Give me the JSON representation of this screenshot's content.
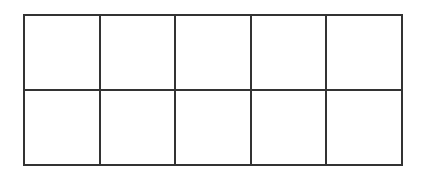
{
  "figure": {
    "type": "ten-frame",
    "columns": 5,
    "rows": 2,
    "total_cells": 10,
    "filled_count": 0,
    "empty_count": 10,
    "background_color": "#ffffff",
    "line_color": "#333333",
    "line_width_px": 2,
    "cell_fill_color": "#ffffff",
    "frame": {
      "left_px": 23,
      "top_px": 14,
      "width_px": 380,
      "height_px": 152,
      "cell_width_px": 76,
      "cell_height_px": 76
    }
  },
  "cells": [
    {
      "id": "cell-r1c1",
      "row": 1,
      "column": 1,
      "filled": false,
      "label": ""
    },
    {
      "id": "cell-r1c2",
      "row": 1,
      "column": 2,
      "filled": false,
      "label": ""
    },
    {
      "id": "cell-r1c3",
      "row": 1,
      "column": 3,
      "filled": false,
      "label": ""
    },
    {
      "id": "cell-r1c4",
      "row": 1,
      "column": 4,
      "filled": false,
      "label": ""
    },
    {
      "id": "cell-r1c5",
      "row": 1,
      "column": 5,
      "filled": false,
      "label": ""
    },
    {
      "id": "cell-r2c1",
      "row": 2,
      "column": 1,
      "filled": false,
      "label": ""
    },
    {
      "id": "cell-r2c2",
      "row": 2,
      "column": 2,
      "filled": false,
      "label": ""
    },
    {
      "id": "cell-r2c3",
      "row": 2,
      "column": 3,
      "filled": false,
      "label": ""
    },
    {
      "id": "cell-r2c4",
      "row": 2,
      "column": 4,
      "filled": false,
      "label": ""
    },
    {
      "id": "cell-r2c5",
      "row": 2,
      "column": 5,
      "filled": false,
      "label": ""
    }
  ]
}
